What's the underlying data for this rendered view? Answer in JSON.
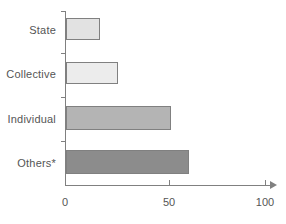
{
  "chart_data": {
    "type": "bar",
    "orientation": "horizontal",
    "title": "",
    "xlabel": "",
    "ylabel": "",
    "categories": [
      "State",
      "Collective",
      "Individual",
      "Others*"
    ],
    "values": [
      17,
      26,
      53,
      62
    ],
    "series": [
      {
        "name": "",
        "values": [
          17,
          26,
          53,
          62
        ]
      }
    ],
    "bar_colors": [
      "#e2e2e2",
      "#ececec",
      "#b4b4b4",
      "#8c8c8c"
    ],
    "bar_border_color": "#808080",
    "xlim": [
      0,
      100
    ],
    "xticks": [
      0,
      50,
      100
    ],
    "xtick_labels": [
      "0",
      "50",
      "100"
    ],
    "grid": false,
    "legend": null,
    "axis_color": "#808080",
    "text_color": "#555555",
    "background": "#ffffff"
  },
  "axis": {
    "x_labels": [
      "0",
      "50",
      "100"
    ]
  },
  "labels": {
    "state": "State",
    "collective": "Collective",
    "individual": "Individual",
    "others": "Others*"
  }
}
